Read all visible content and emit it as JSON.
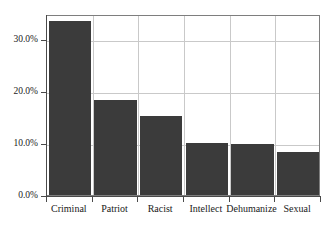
{
  "chart_data": {
    "type": "bar",
    "title": "",
    "subtitle": "",
    "xlabel": "",
    "ylabel": "",
    "categories": [
      "Criminal",
      "Patriot",
      "Racist",
      "Intellect",
      "Dehumanize",
      "Sexual"
    ],
    "values": [
      33.5,
      18.3,
      15.2,
      10.0,
      9.8,
      8.3
    ],
    "value_labels": [
      "33.5%",
      "18.3%",
      "15.2%",
      "10.0%",
      "9.8%",
      "8.3%"
    ],
    "ylim": [
      0,
      34.8
    ],
    "ytick_values": [
      0,
      10,
      20,
      30
    ],
    "ytick_labels": [
      "0.0%",
      "10.0%",
      "20.0%",
      "30.0%"
    ],
    "grid": true,
    "grid_axis": "both",
    "legend": null,
    "legend_position": "none",
    "bar_color": "#3b3b3b",
    "grid_color": "#c9c9c9",
    "axis_color": "#4a4a4a",
    "frame_color": "#7e7e7e",
    "background_color": "#ffffff",
    "text_color": "#1a1a1a"
  }
}
